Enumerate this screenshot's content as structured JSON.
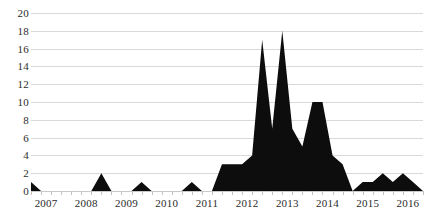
{
  "chart_data": {
    "type": "area",
    "title": "",
    "subtitle": "",
    "xlabel": "",
    "ylabel": "",
    "ylim": [
      0,
      20
    ],
    "y_ticks": [
      0,
      2,
      4,
      6,
      8,
      10,
      12,
      14,
      16,
      18,
      20
    ],
    "x_tick_labels": [
      "2007",
      "2008",
      "2009",
      "2010",
      "2011",
      "2012",
      "2013",
      "2014",
      "2015",
      "2016"
    ],
    "grid": true,
    "legend": "none",
    "series_color": "#0d0d0d",
    "grid_color": "#d9d9d9",
    "axis_color": "#c9c9c9",
    "x_interval": "quarterly",
    "x": [
      "2007 Q1",
      "2007 Q2",
      "2007 Q3",
      "2007 Q4",
      "2008 Q1",
      "2008 Q2",
      "2008 Q3",
      "2008 Q4",
      "2009 Q1",
      "2009 Q2",
      "2009 Q3",
      "2009 Q4",
      "2010 Q1",
      "2010 Q2",
      "2010 Q3",
      "2010 Q4",
      "2011 Q1",
      "2011 Q2",
      "2011 Q3",
      "2011 Q4",
      "2012 Q1",
      "2012 Q2",
      "2012 Q3",
      "2012 Q4",
      "2013 Q1",
      "2013 Q2",
      "2013 Q3",
      "2013 Q4",
      "2014 Q1",
      "2014 Q2",
      "2014 Q3",
      "2014 Q4",
      "2015 Q1",
      "2015 Q2",
      "2015 Q3",
      "2015 Q4",
      "2016 Q1",
      "2016 Q2",
      "2016 Q3",
      "2016 Q4"
    ],
    "series": [
      {
        "name": "Count",
        "values": [
          1,
          0,
          0,
          0,
          0,
          0,
          0,
          2,
          0,
          0,
          0,
          1,
          0,
          0,
          0,
          0,
          1,
          0,
          0,
          3,
          3,
          3,
          4,
          17,
          7,
          18,
          7,
          5,
          10,
          10,
          4,
          3,
          0,
          1,
          1,
          2,
          1,
          2,
          1,
          0
        ]
      }
    ]
  }
}
